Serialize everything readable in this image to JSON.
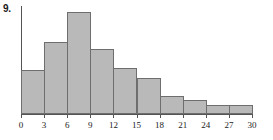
{
  "figure": {
    "number_label": "9.",
    "colors": {
      "bar_fill": "#b9b9b9",
      "bar_stroke": "#6e6e6e",
      "axis": "#555555",
      "text": "#1a1a1a",
      "background": "#ffffff"
    }
  },
  "chart_data": {
    "type": "bar",
    "title": "",
    "subtitle": "",
    "xlabel": "",
    "ylabel": "",
    "grid": false,
    "legend": null,
    "bin_width": 3,
    "xlim": [
      0,
      30
    ],
    "ylim": [
      0,
      10.5
    ],
    "xticks": [
      0,
      3,
      6,
      9,
      12,
      15,
      18,
      21,
      24,
      27,
      30
    ],
    "xtick_labels": [
      "0",
      "3",
      "6",
      "9",
      "12",
      "15",
      "18",
      "21",
      "24",
      "27",
      "30"
    ],
    "yticks": [],
    "ytick_labels": [],
    "categories": [
      "0-3",
      "3-6",
      "6-9",
      "9-12",
      "12-15",
      "15-18",
      "18-21",
      "21-24",
      "24-27",
      "27-30"
    ],
    "bin_edges": [
      0,
      3,
      6,
      9,
      12,
      15,
      18,
      21,
      24,
      27,
      30
    ],
    "values": [
      4.3,
      7.1,
      10.0,
      6.4,
      4.5,
      3.5,
      1.8,
      1.4,
      0.85,
      0.85
    ],
    "bars": [
      {
        "bin": "0-3",
        "x0": 0,
        "x1": 3,
        "value": 4.3
      },
      {
        "bin": "3-6",
        "x0": 3,
        "x1": 6,
        "value": 7.1
      },
      {
        "bin": "6-9",
        "x0": 6,
        "x1": 9,
        "value": 10.0
      },
      {
        "bin": "9-12",
        "x0": 9,
        "x1": 12,
        "value": 6.4
      },
      {
        "bin": "12-15",
        "x0": 12,
        "x1": 15,
        "value": 4.5
      },
      {
        "bin": "15-18",
        "x0": 15,
        "x1": 18,
        "value": 3.5
      },
      {
        "bin": "18-21",
        "x0": 18,
        "x1": 21,
        "value": 1.8
      },
      {
        "bin": "21-24",
        "x0": 21,
        "x1": 24,
        "value": 1.4
      },
      {
        "bin": "24-27",
        "x0": 24,
        "x1": 27,
        "value": 0.85
      },
      {
        "bin": "27-30",
        "x0": 27,
        "x1": 30,
        "value": 0.85
      }
    ]
  }
}
